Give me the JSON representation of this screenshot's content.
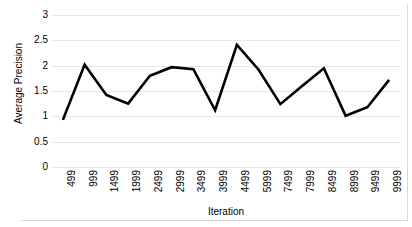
{
  "chart_data": {
    "type": "line",
    "title": "",
    "subtitle": "",
    "xlabel": "Iteration",
    "ylabel": "Average Precision",
    "categories": [
      "499",
      "999",
      "1499",
      "1999",
      "2499",
      "2999",
      "3499",
      "3999",
      "4499",
      "5999",
      "7499",
      "7999",
      "8499",
      "8999",
      "9499",
      "9999"
    ],
    "values": [
      0.93,
      2.02,
      1.42,
      1.25,
      1.8,
      1.97,
      1.93,
      1.12,
      2.41,
      1.92,
      1.24,
      1.6,
      1.95,
      1.01,
      1.18,
      1.72
    ],
    "series": [
      {
        "name": "Average Precision",
        "values": [
          0.93,
          2.02,
          1.42,
          1.25,
          1.8,
          1.97,
          1.93,
          1.12,
          2.41,
          1.92,
          1.24,
          1.6,
          1.95,
          1.01,
          1.18,
          1.72
        ]
      }
    ],
    "ylim": [
      0,
      3
    ],
    "y_ticks": [
      "0",
      "0.5",
      "1",
      "1.5",
      "2",
      "2.5",
      "3"
    ],
    "y_tick_values": [
      0,
      0.5,
      1,
      1.5,
      2,
      2.5,
      3
    ],
    "grid": true,
    "grid_axis": "y",
    "legend": false,
    "legend_position": "none",
    "line_color": "#000000",
    "grid_color": "#e6e6e6",
    "border_color": "#d9d9d9",
    "background_color": "#ffffff",
    "line_width": 2.6,
    "markers": false,
    "x_tick_rotation": -90
  }
}
